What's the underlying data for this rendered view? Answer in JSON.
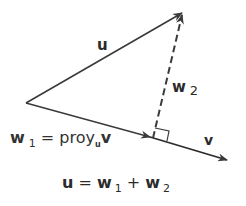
{
  "diagram": {
    "vectors": {
      "u": {
        "label": "u",
        "from": [
          26,
          103
        ],
        "to": [
          183,
          12
        ],
        "style": "solid"
      },
      "w1": {
        "label": "w",
        "subscript": "1",
        "from": [
          26,
          103
        ],
        "to": [
          153,
          138
        ],
        "style": "solid"
      },
      "v": {
        "label": "v",
        "from": [
          153,
          138
        ],
        "to": [
          228,
          160
        ],
        "style": "solid"
      },
      "w2": {
        "label": "w",
        "subscript": "2",
        "from": [
          153,
          138
        ],
        "to": [
          183,
          12
        ],
        "style": "dashed"
      }
    },
    "labels": {
      "u": "u",
      "w2_main": "w",
      "w2_sub": "2",
      "v": "v",
      "w1_main": "w",
      "w1_sub": "1",
      "w1_eq": " = proy",
      "w1_proj_sub": "u",
      "w1_v": "v"
    },
    "equation": {
      "lhs": "u",
      "eq": " = ",
      "w": "w",
      "sub1": "1",
      "plus": " + ",
      "w_b": "w",
      "sub2": "2"
    },
    "colors": {
      "stroke": "#3a3a3a",
      "text": "#2b2b2b"
    }
  }
}
